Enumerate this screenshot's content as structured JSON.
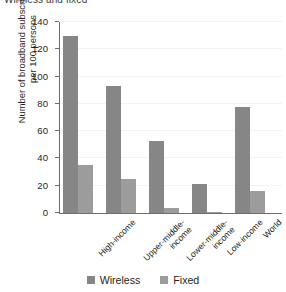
{
  "chart_data": {
    "type": "bar",
    "title": "Wireless and fixed",
    "xlabel": "",
    "ylabel": "Number of broadband subscriptions\nper 100 persons",
    "ylim": [
      0,
      140
    ],
    "yticks": [
      0,
      20,
      40,
      60,
      80,
      100,
      120,
      140
    ],
    "grid": true,
    "legend_position": "bottom",
    "categories": [
      "High-income",
      "Upper-middle-\nincome",
      "Lower-middle-\nincome",
      "Low-income",
      "World"
    ],
    "series": [
      {
        "name": "Wireless",
        "color": "#868686",
        "values": [
          130,
          93,
          53,
          21,
          78
        ]
      },
      {
        "name": "Fixed",
        "color": "#9c9c9c",
        "values": [
          35,
          25,
          4,
          1,
          16
        ]
      }
    ]
  },
  "axis": {
    "ylabel_line1": "Number of broadband subscriptions",
    "ylabel_line2": "per 100 persons",
    "tick_0": "0",
    "tick_20": "20",
    "tick_40": "40",
    "tick_60": "60",
    "tick_80": "80",
    "tick_100": "100",
    "tick_120": "120",
    "tick_140": "140"
  },
  "categories_text": {
    "c0": "High-income",
    "c1": "Upper-middle-\nincome",
    "c2": "Lower-middle-\nincome",
    "c3": "Low-income",
    "c4": "World"
  },
  "legend": {
    "wireless_label": "Wireless",
    "fixed_label": "Fixed"
  },
  "title": {
    "text": "Wireless and fixed"
  }
}
